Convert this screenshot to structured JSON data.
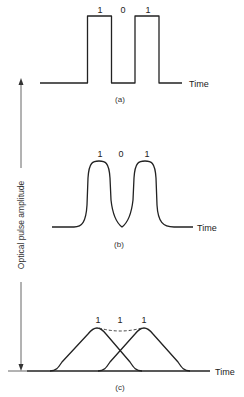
{
  "figure": {
    "y_axis_label": "Optical pulse amplitude",
    "panels": [
      {
        "id": "a",
        "caption": "(a)",
        "x_label": "Time",
        "bits": [
          "1",
          "0",
          "1"
        ],
        "shape": "rectangular pulses"
      },
      {
        "id": "b",
        "caption": "(b)",
        "x_label": "Time",
        "bits": [
          "1",
          "0",
          "1"
        ],
        "shape": "broadened rounded pulses"
      },
      {
        "id": "c",
        "caption": "(c)",
        "x_label": "Time",
        "bits": [
          "1",
          "1",
          "1"
        ],
        "shape": "overlapping pulses (intersymbol interference)"
      }
    ],
    "colors": {
      "line": "#222222",
      "axis": "#555555",
      "background": "#ffffff"
    }
  }
}
